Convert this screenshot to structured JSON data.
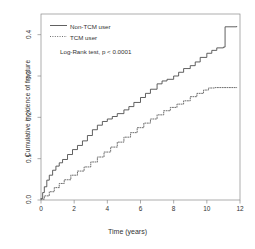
{
  "chart_data": {
    "type": "line",
    "title": "",
    "xlabel": "Time (years)",
    "ylabel": "Cumulative incidence of fracture",
    "xlim": [
      0,
      12
    ],
    "ylim": [
      0,
      0.45
    ],
    "xticks": [
      0,
      2,
      4,
      6,
      8,
      10,
      12
    ],
    "xticklabels": [
      "0",
      "2",
      "4",
      "6",
      "8",
      "10",
      "12"
    ],
    "yticks": [
      0.0,
      0.1,
      0.2,
      0.3,
      0.4
    ],
    "yticklabels": [
      "0.0",
      "0.1",
      "0.2",
      "0.3",
      "0.4"
    ],
    "grid": false,
    "legend_position": "top-left",
    "annotation": "Log-Rank test, p < 0.0001",
    "series": [
      {
        "name": "Non-TCM user",
        "style": "solid",
        "color": "#444444",
        "x": [
          0,
          0.1,
          0.2,
          0.35,
          0.5,
          0.7,
          0.9,
          1.1,
          1.3,
          1.6,
          1.9,
          2.2,
          2.5,
          2.8,
          3.1,
          3.4,
          3.7,
          4.0,
          4.3,
          4.6,
          5.0,
          5.3,
          5.6,
          6.0,
          6.3,
          6.6,
          7.0,
          7.3,
          7.6,
          8.0,
          8.3,
          8.6,
          9.0,
          9.3,
          9.6,
          10.0,
          10.3,
          10.6,
          11.0,
          11.1,
          11.8
        ],
        "y": [
          0.003,
          0.018,
          0.032,
          0.048,
          0.06,
          0.072,
          0.082,
          0.09,
          0.098,
          0.11,
          0.122,
          0.132,
          0.143,
          0.156,
          0.17,
          0.181,
          0.19,
          0.196,
          0.202,
          0.209,
          0.218,
          0.226,
          0.236,
          0.248,
          0.258,
          0.268,
          0.281,
          0.288,
          0.292,
          0.3,
          0.309,
          0.318,
          0.325,
          0.334,
          0.345,
          0.355,
          0.362,
          0.368,
          0.37,
          0.419,
          0.42
        ]
      },
      {
        "name": "TCM user",
        "style": "dotted",
        "color": "#555555",
        "x": [
          0,
          0.2,
          0.5,
          0.8,
          1.1,
          1.4,
          1.8,
          2.2,
          2.6,
          3.0,
          3.4,
          3.8,
          4.2,
          4.6,
          5.0,
          5.4,
          5.8,
          6.2,
          6.6,
          7.0,
          7.4,
          7.8,
          8.2,
          8.6,
          9.0,
          9.4,
          9.8,
          10.1,
          10.5,
          11.0,
          11.5,
          11.8
        ],
        "y": [
          0.002,
          0.01,
          0.02,
          0.03,
          0.04,
          0.049,
          0.06,
          0.07,
          0.08,
          0.092,
          0.104,
          0.116,
          0.128,
          0.14,
          0.152,
          0.163,
          0.175,
          0.186,
          0.196,
          0.206,
          0.216,
          0.224,
          0.232,
          0.24,
          0.25,
          0.258,
          0.266,
          0.271,
          0.272,
          0.272,
          0.272,
          0.272
        ]
      }
    ]
  },
  "legend": {
    "items": [
      {
        "label": "Non-TCM user"
      },
      {
        "label": "TCM user"
      }
    ]
  }
}
